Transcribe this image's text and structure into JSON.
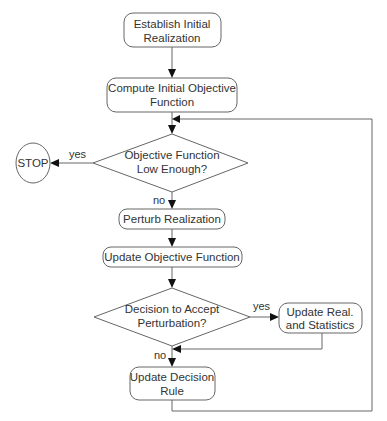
{
  "diagram": {
    "type": "flowchart",
    "nodes": {
      "establish": {
        "line1": "Establish Initial",
        "line2": "Realization"
      },
      "compute": {
        "line1": "Compute Initial Objective",
        "line2": "Function"
      },
      "objective_decision": {
        "line1": "Objective Function",
        "line2": "Low Enough?"
      },
      "stop": {
        "label": "STOP"
      },
      "perturb": {
        "label": "Perturb Realization"
      },
      "update_objective": {
        "label": "Update Objective Function"
      },
      "accept_decision": {
        "line1": "Decision to Accept",
        "line2": "Perturbation?"
      },
      "update_real": {
        "line1": "Update Real.",
        "line2": "and Statistics"
      },
      "update_rule": {
        "line1": "Update Decision",
        "line2": "Rule"
      }
    },
    "edge_labels": {
      "objective_yes": "yes",
      "objective_no": "no",
      "accept_yes": "yes",
      "accept_no": "no"
    }
  }
}
